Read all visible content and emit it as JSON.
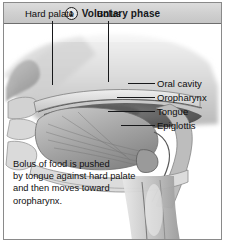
{
  "figure": {
    "header": {
      "step_number": "1",
      "title": "Voluntary phase",
      "band_color": "#cfcfcf",
      "text_color": "#15181c"
    },
    "illustration": {
      "subject": "sagittal-section-of-head-showing-oral-cavity-during-swallowing",
      "style": "grayscale-anatomical-airbrush",
      "orientation": "facing-left"
    },
    "top_labels": [
      {
        "id": "hard-palate",
        "text": "Hard palate"
      },
      {
        "id": "bolus",
        "text": "Bolus"
      }
    ],
    "right_labels": [
      {
        "id": "oral-cavity",
        "text": "Oral cavity"
      },
      {
        "id": "oropharynx",
        "text": "Oropharynx"
      },
      {
        "id": "tongue",
        "text": "Tongue"
      },
      {
        "id": "epiglottis",
        "text": "Epiglottis"
      }
    ],
    "caption": {
      "line1": "Bolus of food is pushed",
      "line2": "by tongue against hard palate",
      "line3": "and then moves toward",
      "line4": "oropharynx."
    }
  }
}
